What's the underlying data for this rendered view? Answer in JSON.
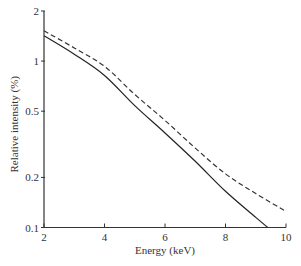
{
  "chart_data": {
    "type": "line",
    "title": "",
    "xlabel": "Energy (keV)",
    "ylabel": "Relative intensity (%)",
    "xlim": [
      2,
      10
    ],
    "ylim": [
      0.1,
      2
    ],
    "yscale": "log",
    "grid": false,
    "legend": "none",
    "xticks": [
      2,
      4,
      6,
      8,
      10
    ],
    "xtick_labels": [
      "2",
      "4",
      "6",
      "8",
      "10"
    ],
    "yticks": [
      0.1,
      0.2,
      0.5,
      1,
      2
    ],
    "ytick_labels": [
      "0.1",
      "0.2",
      "0.5",
      "1",
      "2"
    ],
    "series": [
      {
        "name": "solid",
        "style": "solid",
        "x": [
          2,
          3,
          4,
          5,
          6,
          7,
          8,
          9,
          9.4
        ],
        "y": [
          1.42,
          1.1,
          0.82,
          0.54,
          0.37,
          0.25,
          0.165,
          0.115,
          0.1
        ]
      },
      {
        "name": "dashed",
        "style": "dashed",
        "x": [
          2,
          3,
          4,
          5,
          6,
          7,
          8,
          9,
          10
        ],
        "y": [
          1.52,
          1.2,
          0.93,
          0.63,
          0.44,
          0.3,
          0.21,
          0.16,
          0.125
        ]
      }
    ]
  }
}
